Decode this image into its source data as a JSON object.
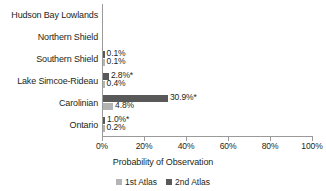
{
  "chart_data": {
    "type": "bar",
    "orientation": "horizontal",
    "title": "",
    "xlabel": "Probability of Observation",
    "ylabel": "",
    "xlim": [
      0,
      100
    ],
    "xtick_labels": [
      "0%",
      "20%",
      "40%",
      "60%",
      "80%",
      "100%"
    ],
    "xticks": [
      0,
      20,
      40,
      60,
      80,
      100
    ],
    "grid": false,
    "legend_position": "bottom",
    "categories": [
      "Hudson Bay Lowlands",
      "Northern Shield",
      "Southern Shield",
      "Lake Simcoe-Rideau",
      "Carolinian",
      "Ontario"
    ],
    "series": [
      {
        "name": "1st Atlas",
        "color": "#b4b4b4",
        "values": [
          0,
          0,
          0.1,
          0.4,
          4.8,
          0.2
        ],
        "labels": [
          "",
          "",
          "0.1%",
          "0.4%",
          "4.8%",
          "0.2%"
        ]
      },
      {
        "name": "2nd Atlas",
        "color": "#595959",
        "values": [
          0,
          0,
          0.1,
          2.8,
          30.9,
          1.0
        ],
        "labels": [
          "",
          "",
          "0.1%",
          "2.8%*",
          "30.9%*",
          "1.0%*"
        ]
      }
    ]
  },
  "legend": {
    "items": [
      {
        "label": "1st Atlas",
        "color": "#b4b4b4"
      },
      {
        "label": "2nd Atlas",
        "color": "#595959"
      }
    ]
  },
  "axis": {
    "x_title": "Probability of Observation"
  }
}
